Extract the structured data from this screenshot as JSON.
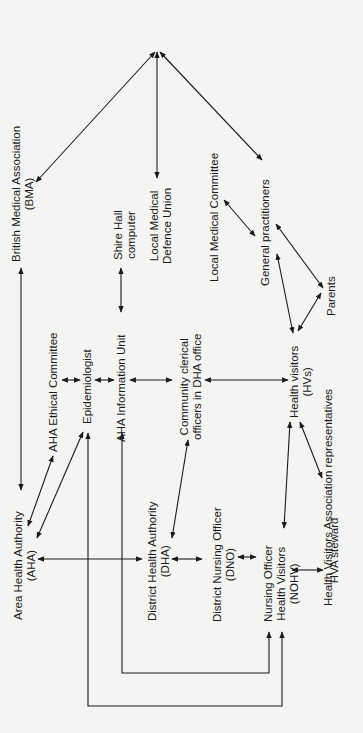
{
  "diagram": {
    "title": "",
    "background": "#f4f4f2",
    "line_color": "#1a1a1a",
    "nodes": {
      "bma": {
        "line1": "British Medical Association",
        "line2": "(BMA)"
      },
      "shire": {
        "line1": "Shire Hall",
        "line2": "computer"
      },
      "lmdu": {
        "line1": "Local Medical",
        "line2": "Defence Union"
      },
      "lmc": {
        "line1": "Local Medical Committee"
      },
      "gp": {
        "line1": "General practitioners"
      },
      "parents": {
        "line1": "Parents"
      },
      "aha_eth": {
        "line1": "AHA Ethical Committee"
      },
      "epi": {
        "line1": "Epidemiologist"
      },
      "aha_info": {
        "line1": "AHA Information Unit"
      },
      "clerical": {
        "line1": "Community clerical",
        "line2": "officers in DHA office"
      },
      "hv": {
        "line1": "Health visitors",
        "line2": "(HVs)"
      },
      "hva_rep": {
        "line1": "Health Visitors Association representatives"
      },
      "aha": {
        "line1": "Area Health Authority",
        "line2": "(AHA)"
      },
      "dha": {
        "line1": "District Health Authority",
        "line2": "(DHA)"
      },
      "dno": {
        "line1": "District Nursing Officer",
        "line2": "(DNO)"
      },
      "nohv": {
        "line1": "Nursing Officer",
        "line2": "Health Visitors",
        "line3": "(NOHV)"
      },
      "hva_steward": {
        "line1": "Health Visitors Association",
        "line2": "HVA steward"
      }
    }
  }
}
